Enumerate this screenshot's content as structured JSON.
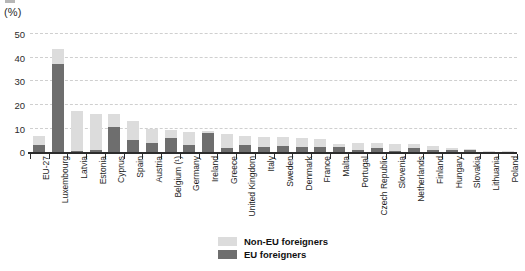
{
  "axis": {
    "unit_label": "(%)",
    "yticks": [
      0,
      10,
      20,
      30,
      40,
      50
    ]
  },
  "legend": {
    "items": [
      {
        "label": "Non-EU foreigners",
        "color": "#dcdcdc",
        "key": "non_eu"
      },
      {
        "label": "EU foreigners",
        "color": "#6e6e6e",
        "key": "eu"
      }
    ]
  },
  "chart_data": {
    "type": "bar",
    "stacked": true,
    "title": "",
    "subtitle": "",
    "xlabel": "",
    "ylabel": "(%)",
    "ylim": [
      0,
      52
    ],
    "yticks": [
      0,
      10,
      20,
      30,
      40,
      50
    ],
    "grid": true,
    "legend_position": "bottom-center",
    "categories": [
      "EU-27",
      "Luxembourg",
      "Latvia",
      "Estonia",
      "Cyprus",
      "Spain",
      "Austria",
      "Belgium (¹)",
      "Germany",
      "Ireland",
      "Greece",
      "United Kingdom",
      "Italy",
      "Sweden",
      "Denmark",
      "France",
      "Malta",
      "Portugal",
      "Czech Republic",
      "Slovenia",
      "Netherlands",
      "Finland",
      "Hungary",
      "Slovakia",
      "Lithuania",
      "Poland"
    ],
    "series": [
      {
        "name": "EU foreigners",
        "color": "#6e6e6e",
        "values": [
          3.0,
          37.0,
          0.3,
          0.8,
          10.3,
          5.0,
          3.6,
          5.9,
          3.1,
          7.9,
          1.6,
          3.1,
          1.9,
          2.7,
          2.0,
          2.2,
          2.3,
          1.0,
          1.5,
          0.6,
          1.7,
          0.8,
          1.0,
          0.9,
          0.2,
          0.1
        ]
      },
      {
        "name": "Non-EU foreigners",
        "color": "#dcdcdc",
        "values": [
          3.8,
          6.0,
          17.0,
          15.2,
          5.7,
          7.8,
          6.0,
          3.4,
          5.5,
          0.8,
          6.1,
          3.5,
          4.4,
          3.4,
          3.7,
          3.3,
          1.0,
          2.8,
          2.1,
          2.7,
          1.6,
          1.7,
          0.8,
          0.4,
          0.4,
          0.2
        ]
      }
    ],
    "totals": [
      6.8,
      43.0,
      17.3,
      16.0,
      16.0,
      12.8,
      9.6,
      9.3,
      8.6,
      8.7,
      7.7,
      6.6,
      6.3,
      6.1,
      5.7,
      5.5,
      3.3,
      3.8,
      3.6,
      3.3,
      3.3,
      2.5,
      1.8,
      1.3,
      0.6,
      0.3
    ]
  }
}
